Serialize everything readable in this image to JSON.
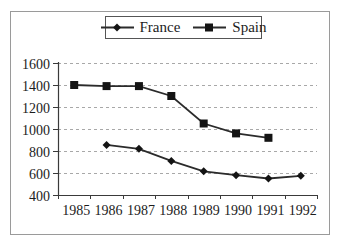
{
  "chart_data": {
    "type": "line",
    "title": "",
    "categories": [
      "1985",
      "1986",
      "1987",
      "1988",
      "1989",
      "1990",
      "1991",
      "1992"
    ],
    "series": [
      {
        "name": "France",
        "marker": "diamond",
        "values": [
          null,
          855,
          820,
          710,
          615,
          580,
          550,
          575
        ]
      },
      {
        "name": "Spain",
        "marker": "square",
        "values": [
          1400,
          1390,
          1390,
          1300,
          1050,
          960,
          920,
          null
        ]
      }
    ],
    "ylim": [
      400,
      1600
    ],
    "yticks": [
      400,
      600,
      800,
      1000,
      1200,
      1400,
      1600
    ],
    "xlabel": "",
    "ylabel": "",
    "grid": "horizontal-dashed",
    "legend_position": "top"
  },
  "colors": {
    "background": "#ffffff",
    "series_line": "#2b2b2b",
    "marker_fill": "#141414",
    "text": "#1c1c1c",
    "gridline": "#a8a8a8",
    "axis": "#3a3a3a",
    "frame_border": "#9a9a9a",
    "legend_border": "#555555"
  }
}
